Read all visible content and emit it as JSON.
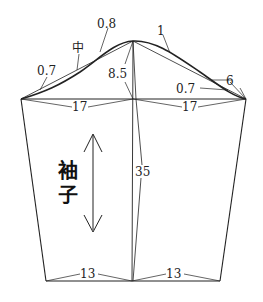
{
  "diagram": {
    "type": "sleeve-pattern",
    "title_vertical": [
      "袖",
      "子"
    ],
    "measurements": {
      "cap_front_offset": "0.7",
      "cap_mid_label": "中",
      "cap_top_offset": "0.8",
      "cap_back_offset": "1",
      "cap_back_lower_offset": "0.7",
      "cap_back_segment": "6",
      "cap_height": "8.5",
      "half_width_left": "17",
      "half_width_right": "17",
      "sleeve_length": "35",
      "cuff_left": "13",
      "cuff_right": "13"
    },
    "colors": {
      "line": "#222222",
      "background": "#ffffff"
    }
  }
}
